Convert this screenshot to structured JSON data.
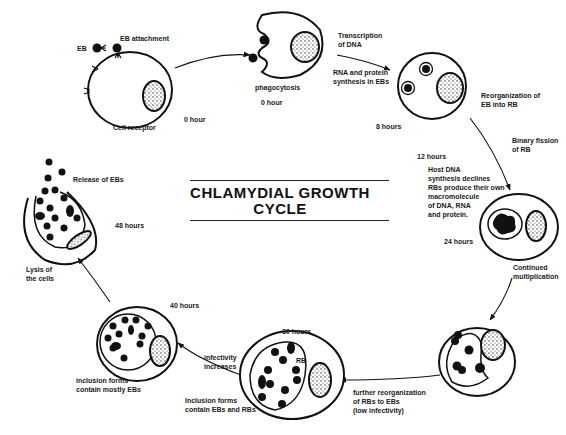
{
  "title": {
    "line1": "CHLAMYDIAL GROWTH",
    "line2": "CYCLE"
  },
  "stages": [
    {
      "id": "attachment",
      "labels": {
        "eb": "EB",
        "attachment": "EB attachment",
        "receptor": "Cell receptor",
        "time": "0 hour"
      }
    },
    {
      "id": "phagocytosis",
      "labels": {
        "nucleus": "nucleus",
        "process": "phagocytosis",
        "time": "0 hour",
        "transcription": "Transcription\nof DNA",
        "rna": "RNA and protein\nsynthesis in EBs"
      }
    },
    {
      "id": "reorganization",
      "labels": {
        "process": "Reorganization of\nEB into RB",
        "time": "8 hours"
      }
    },
    {
      "id": "binary-fission",
      "labels": {
        "process": "Binary fission\nof RB",
        "time": "12 hours",
        "note": "Host DNA\nsynthesis declines\nRBs produce their own\nmacromolecule\nof DNA, RNA\nand protein.",
        "time2": "24 hours"
      }
    },
    {
      "id": "multiplication",
      "labels": {
        "process": "Continued\nmultiplication"
      }
    },
    {
      "id": "further-reorganization",
      "labels": {
        "process": "further reorganization\nof RBs to EBs\n(low infectivity)"
      }
    },
    {
      "id": "inclusion-eb-rb",
      "labels": {
        "time": "30 hours",
        "rb": "RB",
        "eb": "EB",
        "process": "Inclusion forms\ncontain EBs and RBs",
        "infectivity": "infectivity\nincreases"
      }
    },
    {
      "id": "inclusion-mostly-eb",
      "labels": {
        "time": "40 hours",
        "process": "inclusion forms\ncontain mostly EBs"
      }
    },
    {
      "id": "lysis",
      "labels": {
        "release": "Release of EBs",
        "time": "48 hours",
        "lysis": "Lysis of\nthe cells"
      }
    }
  ]
}
